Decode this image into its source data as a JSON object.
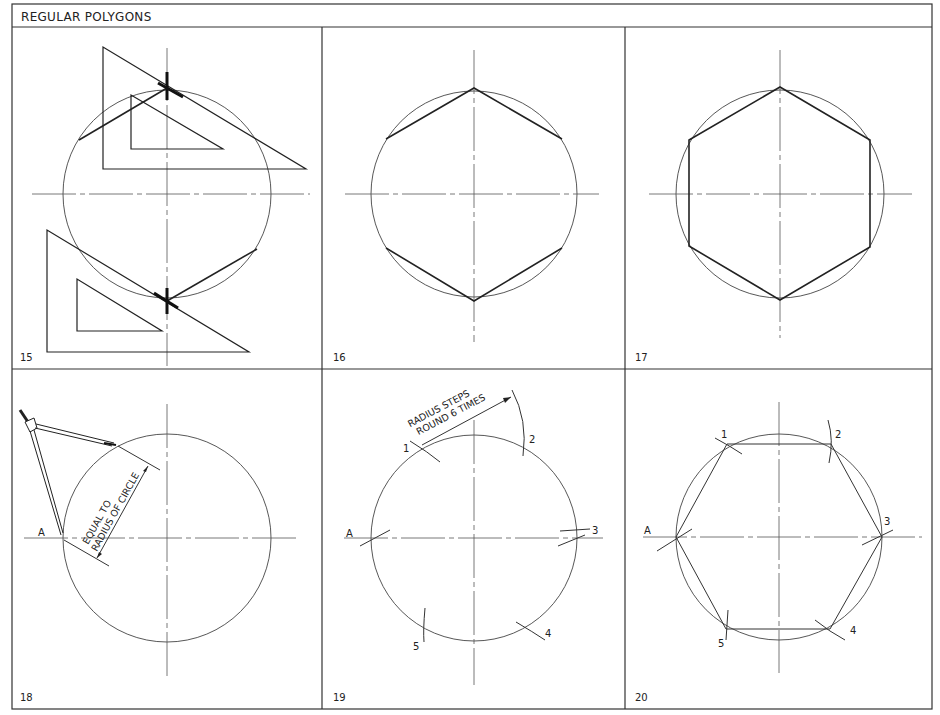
{
  "title": "REGULAR POLYGONS",
  "panels": [
    {
      "number": "15",
      "description": "Set squares (30-60 triangles) drawing hexagon sides from circle top and bottom points"
    },
    {
      "number": "16",
      "description": "Four sloping sides of hexagon inscribed in circle"
    },
    {
      "number": "17",
      "description": "Completed hexagon with vertical sides"
    },
    {
      "number": "18",
      "description": "Compass set equal to radius of circle at point A",
      "point_label": "A",
      "annotation_line1": "EQUAL TO",
      "annotation_line2": "RADIUS OF CIRCLE"
    },
    {
      "number": "19",
      "description": "Radius stepped round circle 6 times",
      "point_labels": [
        "A",
        "1",
        "2",
        "3",
        "4",
        "5"
      ],
      "annotation_line1": "RADIUS STEPS",
      "annotation_line2": "ROUND 6 TIMES"
    },
    {
      "number": "20",
      "description": "Hexagon joined through stepped points",
      "point_labels": [
        "A",
        "1",
        "2",
        "3",
        "4",
        "5"
      ]
    }
  ]
}
